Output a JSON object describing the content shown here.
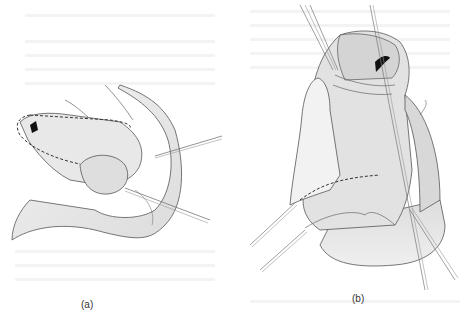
{
  "figure": {
    "panels": [
      {
        "id": "a",
        "label": "(a)"
      },
      {
        "id": "b",
        "label": "(b)"
      }
    ],
    "colors": {
      "background": "#ffffff",
      "tissue_fill": "#e6e6e6",
      "tissue_fill_light": "#f0f0f0",
      "outline": "#555555",
      "dashed_incision": "#333333",
      "opening": "#111111",
      "ghost_text": "#f3f3f3"
    }
  }
}
